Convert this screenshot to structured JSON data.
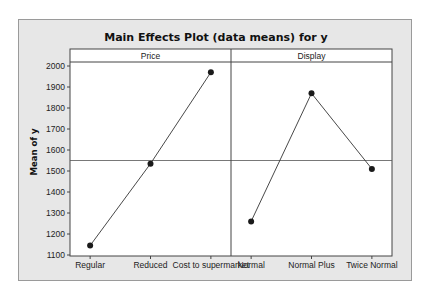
{
  "chart_data": {
    "type": "line",
    "title": "Main Effects Plot (data means) for y",
    "ylabel": "Mean of y",
    "xlabel": "",
    "ylim": [
      1080,
      2020
    ],
    "yticks": [
      1100,
      1200,
      1300,
      1400,
      1500,
      1600,
      1700,
      1800,
      1900,
      2000
    ],
    "ytick_labels": [
      "1100",
      "1200",
      "1300",
      "1400",
      "1500",
      "1600",
      "1700",
      "1800",
      "1900",
      "2000"
    ],
    "reference_line": 1550,
    "grid": false,
    "legend": "none",
    "panels": [
      {
        "name": "Price",
        "categories": [
          "Regular",
          "Reduced",
          "Cost to supermarket"
        ],
        "values": [
          1145,
          1535,
          1970
        ]
      },
      {
        "name": "Display",
        "categories": [
          "Normal",
          "Normal Plus",
          "Twice Normal"
        ],
        "values": [
          1260,
          1870,
          1510
        ]
      }
    ],
    "colors": {
      "frame_bg": "#e7e7e7",
      "plot_bg": "#ffffff",
      "line": "#333333",
      "marker": "#1a1a1a",
      "axis": "#444444"
    }
  }
}
